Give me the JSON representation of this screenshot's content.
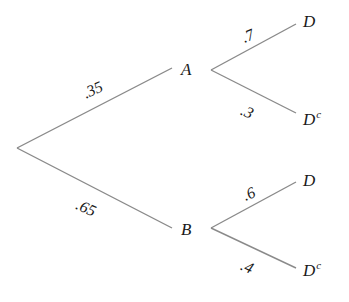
{
  "diagram": {
    "type": "probability-tree",
    "line_color": "#8a8a8a",
    "root": {
      "x": 17,
      "y": 148
    },
    "nodes": {
      "A": {
        "label": "A",
        "x": 181,
        "y": 61
      },
      "B": {
        "label": "B",
        "x": 181,
        "y": 221
      },
      "A_D": {
        "label": "D",
        "sup": "",
        "x": 303,
        "y": 13
      },
      "A_Dc": {
        "label": "D",
        "sup": "c",
        "x": 303,
        "y": 109
      },
      "B_D": {
        "label": "D",
        "sup": "",
        "x": 303,
        "y": 172
      },
      "B_Dc": {
        "label": "D",
        "sup": "c",
        "x": 303,
        "y": 260
      }
    },
    "probabilities": {
      "root_A": ".35",
      "root_B": ".65",
      "A_D": ".7",
      "A_Dc": ".3",
      "B_D": ".6",
      "B_Dc": ".4"
    },
    "edges": [
      {
        "name": "edge-root-A",
        "x1": 17,
        "y1": 148,
        "x2": 172,
        "y2": 68
      },
      {
        "name": "edge-root-B",
        "x1": 17,
        "y1": 148,
        "x2": 172,
        "y2": 228
      },
      {
        "name": "edge-A-D",
        "x1": 211,
        "y1": 70,
        "x2": 296,
        "y2": 24
      },
      {
        "name": "edge-A-Dc",
        "x1": 211,
        "y1": 70,
        "x2": 296,
        "y2": 113
      },
      {
        "name": "edge-B-D",
        "x1": 211,
        "y1": 228,
        "x2": 296,
        "y2": 182
      },
      {
        "name": "edge-B-Dc",
        "x1": 211,
        "y1": 228,
        "x2": 296,
        "y2": 268
      }
    ]
  }
}
